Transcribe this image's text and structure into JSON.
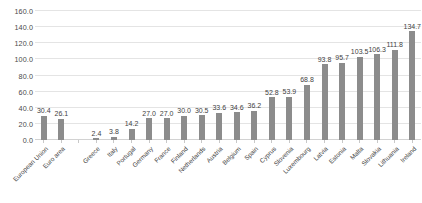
{
  "chart_data": {
    "type": "bar",
    "title": "",
    "subtitle": "",
    "xlabel": "",
    "ylabel": "",
    "ylim": [
      0.0,
      160.0
    ],
    "yticks": [
      "0.0",
      "20.0",
      "40.0",
      "60.0",
      "80.0",
      "100.0",
      "120.0",
      "140.0",
      "160.0"
    ],
    "ytick_values": [
      0.0,
      20.0,
      40.0,
      60.0,
      80.0,
      100.0,
      120.0,
      140.0,
      160.0
    ],
    "grid": true,
    "legend": "none",
    "bar_color": "#8c8c8c",
    "gridline_color": "#e4e4e4",
    "categories": [
      "European Union",
      "Euro area",
      "",
      "Greece",
      "Italy",
      "Portugal",
      "Germany",
      "France",
      "Finland",
      "Netherlands",
      "Austria",
      "Belgium",
      "Spain",
      "Cyprus",
      "Slovenia",
      "Luxembourg",
      "Latvia",
      "Estonia",
      "Malta",
      "Slovakia",
      "Lithuania",
      "Ireland"
    ],
    "values": [
      30.4,
      26.1,
      null,
      2.4,
      3.8,
      14.2,
      27.0,
      27.0,
      30.0,
      30.5,
      33.6,
      34.6,
      36.2,
      52.8,
      53.9,
      68.8,
      93.8,
      95.7,
      103.5,
      106.3,
      111.8,
      134.7
    ],
    "labels": [
      "30.4",
      "26.1",
      "",
      "2.4",
      "3.8",
      "14.2",
      "27.0",
      "27.0",
      "30.0",
      "30.5",
      "33.6",
      "34.6",
      "36.2",
      "52.8",
      "53.9",
      "68.8",
      "93.8",
      "95.7",
      "103.5",
      "106.3",
      "111.8",
      "134.7"
    ]
  }
}
